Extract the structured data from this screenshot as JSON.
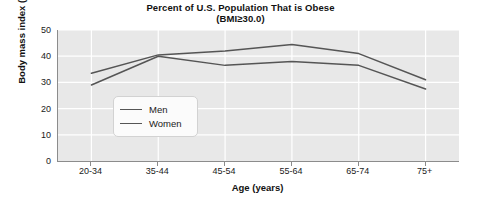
{
  "chart_data": {
    "type": "line",
    "title": "Percent of U.S. Population That is Obese",
    "subtitle": "(BMI≥30.0)",
    "xlabel": "Age (years)",
    "ylabel": "Body mass index (BMI)",
    "categories": [
      "20-34",
      "35-44",
      "45-54",
      "55-64",
      "65-74",
      "75+"
    ],
    "series": [
      {
        "name": "Men",
        "values": [
          29.0,
          40.0,
          36.5,
          38.0,
          36.5,
          27.5
        ],
        "color": "#555555"
      },
      {
        "name": "Women",
        "values": [
          33.5,
          40.5,
          42.0,
          44.5,
          41.0,
          31.0
        ],
        "color": "#555555"
      }
    ],
    "ylim": [
      0,
      50
    ],
    "yticks": [
      0,
      10,
      20,
      30,
      40,
      50
    ],
    "grid": true,
    "legend_position": "inside-left",
    "plot_background": "#e8e8e8",
    "gridline_color": "#ffffff",
    "axis_color": "#8c8c8c"
  },
  "legend": {
    "entries": [
      {
        "label": "Men"
      },
      {
        "label": "Women"
      }
    ]
  }
}
